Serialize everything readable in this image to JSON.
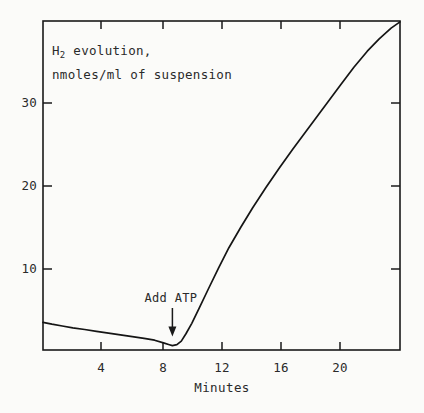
{
  "figure": {
    "name": "h2-evolution-time-course",
    "background_color": "#fbfbf9",
    "ink_color": "#1a1a1a"
  },
  "chart_data": {
    "type": "line",
    "title": "H2 evolution, nmoles/ml of suspension",
    "title_line1_main": "H",
    "title_line1_sub": "2",
    "title_line1_rest": " evolution,",
    "title_line2": "nmoles/ml of suspension",
    "xlabel": "Minutes",
    "ylabel": "H2 evolution, nmoles/ml of suspension",
    "xlim": [
      0,
      24
    ],
    "ylim": [
      0,
      37
    ],
    "grid": false,
    "legend": "none",
    "xticks": [
      4,
      8,
      12,
      16,
      20
    ],
    "xtick_labels": [
      "4",
      "8",
      "12",
      "16",
      "20"
    ],
    "yticks": [
      10,
      20,
      30
    ],
    "ytick_labels": [
      "10",
      "20",
      "30"
    ],
    "ticks_direction": "inward",
    "ticks_on_all_sides": true,
    "series": [
      {
        "name": "H2 evolution",
        "x": [
          0.0,
          0.6,
          1.3,
          2.0,
          2.8,
          3.6,
          4.4,
          5.2,
          6.0,
          6.8,
          7.5,
          8.1,
          8.5,
          8.7,
          9.0,
          9.3,
          9.6,
          10.0,
          10.5,
          11.1,
          11.8,
          12.5,
          13.3,
          14.1,
          15.0,
          15.9,
          16.8,
          17.6,
          18.4,
          19.2,
          20.0,
          20.9,
          21.8,
          22.6,
          23.4,
          24.0
        ],
        "y": [
          3.1,
          2.9,
          2.7,
          2.5,
          2.3,
          2.1,
          1.9,
          1.7,
          1.5,
          1.3,
          1.1,
          0.8,
          0.6,
          0.5,
          0.6,
          1.0,
          1.8,
          3.0,
          4.7,
          6.8,
          9.2,
          11.5,
          13.8,
          16.0,
          18.3,
          20.5,
          22.6,
          24.4,
          26.2,
          28.0,
          29.8,
          31.8,
          33.6,
          35.0,
          36.2,
          36.9
        ]
      }
    ],
    "annotations": [
      {
        "name": "add-atp",
        "text": "Add ATP",
        "x": 8.7,
        "y": 0.5,
        "arrow": "down",
        "label_x": 8.6,
        "label_y": 5.4
      }
    ]
  }
}
